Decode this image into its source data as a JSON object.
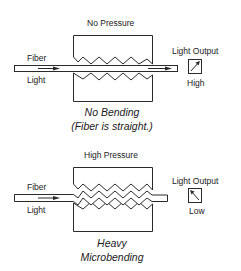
{
  "diagram": {
    "top": {
      "pressure_label": "No Pressure",
      "fiber_label": "Fiber",
      "light_label": "Light",
      "output_label": "Light Output",
      "meter_reading": "High",
      "caption_line1": "No Bending",
      "caption_line2": "(Fiber is straight.)"
    },
    "bottom": {
      "pressure_label": "High Pressure",
      "fiber_label": "Fiber",
      "light_label": "Light",
      "output_label": "Light Output",
      "meter_reading": "Low",
      "caption_line1": "Heavy",
      "caption_line2": "Microbending"
    },
    "colors": {
      "line": "#2a2a2a",
      "background": "#ffffff"
    }
  }
}
